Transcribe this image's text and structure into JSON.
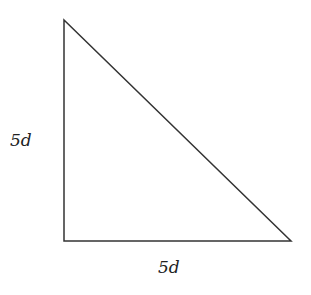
{
  "diagram": {
    "type": "right-triangle",
    "vertices": {
      "top": [
        64,
        20
      ],
      "right_angle": [
        64,
        241
      ],
      "right": [
        291,
        241
      ]
    },
    "stroke_color": "#333333",
    "labels": {
      "vertical_leg": "5d",
      "horizontal_leg": "5d"
    }
  }
}
